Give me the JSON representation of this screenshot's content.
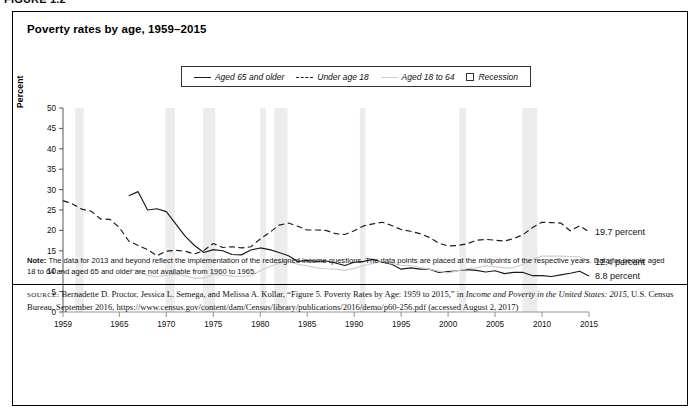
{
  "figure": {
    "number_label": "FIGURE 1.2",
    "title": "Poverty rates by age, 1959–2015"
  },
  "legend": {
    "items": [
      {
        "label": "Aged 65 and older",
        "style": "solid",
        "color": "#1a1a1a",
        "icon": "line-solid-icon"
      },
      {
        "label": "Under age 18",
        "style": "dashed",
        "color": "#1a1a1a",
        "icon": "line-dashed-icon"
      },
      {
        "label": "Aged 18 to 64",
        "style": "light",
        "color": "#cfcfcf",
        "icon": "line-light-icon"
      },
      {
        "label": "Recession",
        "style": "box",
        "color": "#ececec",
        "icon": "square-outline-icon"
      }
    ]
  },
  "end_labels": [
    {
      "text": "19.7 percent",
      "value": 19.7,
      "series": "Under age 18"
    },
    {
      "text": "12.4 percent",
      "value": 12.4,
      "series": "Aged 18 to 64"
    },
    {
      "text": "8.8 percent",
      "value": 8.8,
      "series": "Aged 65 and older"
    }
  ],
  "note": {
    "label": "Note:",
    "text": "The data for 2013 and beyond reflect the implementation of the redesigned income questions. The data points are placed at the midpoints of the respective years. Data for people aged 18 to 64 and aged 65 and older are not available from 1960 to 1965."
  },
  "source": {
    "label": "SOURCE:",
    "line1_a": "Bernadette D. Proctor, Jessica L. Semega, and Melissa A. Kollar, “Figure 5. Poverty Rates by Age: 1959 to 2015,” in ",
    "line1_italic": "Income and Poverty in the United States: 2015",
    "line2_a": ", U.S. Census Bureau, September 2016, https://www.census.gov/content/dam/Census/library/publications/2016/demo/p60-256.pdf (accessed August 2, 2017)"
  },
  "chart_data": {
    "type": "line",
    "title": "Poverty rates by age, 1959–2015",
    "xlabel": "",
    "ylabel": "Percent",
    "xlim": [
      1959,
      2015
    ],
    "ylim": [
      0,
      50
    ],
    "yticks": [
      0,
      5,
      10,
      15,
      20,
      25,
      30,
      35,
      40,
      45,
      50
    ],
    "xticks": [
      1959,
      1965,
      1970,
      1975,
      1980,
      1985,
      1990,
      1995,
      2000,
      2005,
      2010,
      2015
    ],
    "grid": false,
    "legend_position": "top-center",
    "x": [
      1959,
      1960,
      1961,
      1962,
      1963,
      1964,
      1965,
      1966,
      1967,
      1968,
      1969,
      1970,
      1971,
      1972,
      1973,
      1974,
      1975,
      1976,
      1977,
      1978,
      1979,
      1980,
      1981,
      1982,
      1983,
      1984,
      1985,
      1986,
      1987,
      1988,
      1989,
      1990,
      1991,
      1992,
      1993,
      1994,
      1995,
      1996,
      1997,
      1998,
      1999,
      2000,
      2001,
      2002,
      2003,
      2004,
      2005,
      2006,
      2007,
      2008,
      2009,
      2010,
      2011,
      2012,
      2013,
      2014,
      2015
    ],
    "series": [
      {
        "name": "Aged 65 and older",
        "style": "solid",
        "color": "#1a1a1a",
        "values": [
          35.2,
          null,
          null,
          null,
          null,
          null,
          null,
          28.5,
          29.5,
          25.0,
          25.3,
          24.6,
          21.6,
          18.6,
          16.3,
          14.6,
          15.3,
          15.0,
          14.1,
          14.0,
          15.2,
          15.7,
          15.3,
          14.6,
          13.8,
          12.4,
          12.6,
          12.4,
          12.5,
          12.0,
          11.4,
          12.2,
          12.4,
          12.9,
          12.2,
          11.7,
          10.5,
          10.8,
          10.5,
          10.5,
          9.7,
          9.9,
          10.1,
          10.4,
          10.2,
          9.8,
          10.1,
          9.4,
          9.7,
          9.7,
          8.9,
          8.9,
          8.7,
          9.1,
          9.5,
          10.0,
          8.8
        ]
      },
      {
        "name": "Under age 18",
        "style": "dashed",
        "color": "#1a1a1a",
        "values": [
          27.3,
          26.5,
          25.2,
          24.7,
          22.8,
          22.7,
          20.7,
          17.4,
          16.3,
          15.3,
          13.8,
          14.9,
          15.1,
          14.9,
          14.2,
          15.1,
          16.8,
          15.8,
          16.0,
          15.7,
          16.0,
          17.9,
          19.5,
          21.3,
          21.8,
          21.0,
          20.1,
          20.1,
          20.0,
          19.2,
          19.0,
          19.9,
          21.1,
          21.6,
          22.0,
          21.2,
          20.2,
          19.8,
          19.2,
          18.3,
          16.9,
          16.2,
          16.3,
          16.7,
          17.6,
          17.8,
          17.6,
          17.4,
          18.0,
          19.0,
          20.7,
          22.0,
          21.9,
          21.8,
          19.9,
          21.1,
          19.7
        ]
      },
      {
        "name": "Aged 18 to 64",
        "style": "light",
        "color": "#cfcfcf",
        "values": [
          17.0,
          null,
          null,
          null,
          null,
          null,
          null,
          10.5,
          10.0,
          9.0,
          8.7,
          9.0,
          9.3,
          8.8,
          8.3,
          8.3,
          9.2,
          9.0,
          8.8,
          8.7,
          8.9,
          10.1,
          11.1,
          12.0,
          12.4,
          11.7,
          11.3,
          10.8,
          10.6,
          10.5,
          10.2,
          10.7,
          11.4,
          11.9,
          12.4,
          11.9,
          11.4,
          11.4,
          10.9,
          10.5,
          10.0,
          9.6,
          10.1,
          10.6,
          10.8,
          11.3,
          11.1,
          10.8,
          10.9,
          11.7,
          12.9,
          13.7,
          13.7,
          13.7,
          13.6,
          13.5,
          12.4
        ]
      }
    ],
    "recessions": [
      {
        "start": 1960.3,
        "end": 1961.2
      },
      {
        "start": 1969.9,
        "end": 1970.9
      },
      {
        "start": 1973.9,
        "end": 1975.2
      },
      {
        "start": 1980.0,
        "end": 1980.6
      },
      {
        "start": 1981.5,
        "end": 1982.9
      },
      {
        "start": 1990.6,
        "end": 1991.2
      },
      {
        "start": 2001.2,
        "end": 2001.9
      },
      {
        "start": 2007.9,
        "end": 2009.5
      }
    ],
    "recession_color": "#ececec"
  }
}
